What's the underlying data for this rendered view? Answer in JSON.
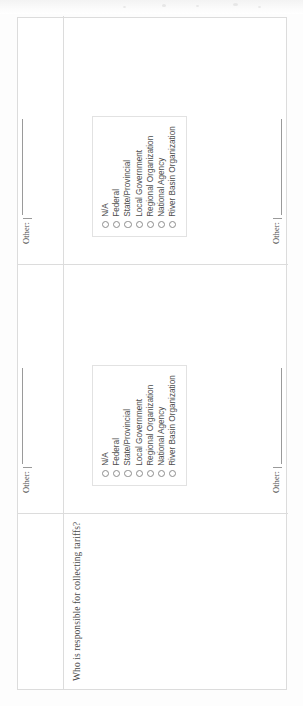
{
  "document": {
    "type": "scanned-survey-form",
    "orientation": "rotated-90",
    "background_color": "#ffffff",
    "rule_color": "#9a9a9a",
    "border_color": "#dcdcdc",
    "text_color": "#4a4a4a"
  },
  "question": {
    "text": "Who is responsible for collecting tariffs?"
  },
  "options": [
    {
      "label": "N/A",
      "checked": false
    },
    {
      "label": "Federal",
      "checked": false
    },
    {
      "label": "State/Provincial",
      "checked": false
    },
    {
      "label": "Local Government",
      "checked": false
    },
    {
      "label": "Regional Organization",
      "checked": false
    },
    {
      "label": "National Agency",
      "checked": false
    },
    {
      "label": "River Basin Organization",
      "checked": false
    }
  ],
  "other_fields": [
    {
      "label": "Other:",
      "value": ""
    },
    {
      "label": "Other:",
      "value": ""
    },
    {
      "label": "Other:",
      "value": ""
    },
    {
      "label": "Other:",
      "value": ""
    }
  ],
  "answer_columns": [
    {
      "name": "column-1"
    },
    {
      "name": "column-2"
    }
  ]
}
